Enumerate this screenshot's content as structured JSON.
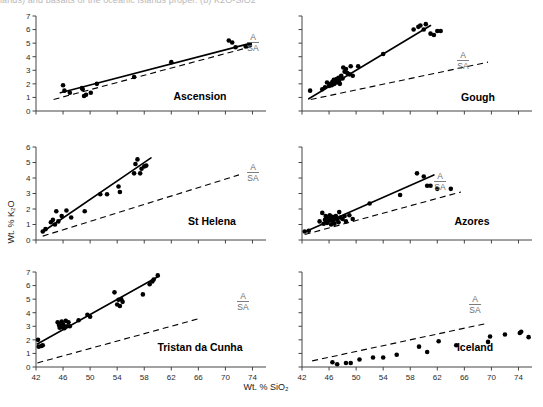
{
  "figure": {
    "top_cut_text": "lands) and basalts of the oceanic islands proper. (b)  K2O-SiO2",
    "x_axis_label": "Wt. % SiO₂",
    "y_axis_label": "Wt. % K₂O",
    "divider_label_top": "A",
    "divider_label_bottom": "SA",
    "colors": {
      "point": "#000000",
      "fit_line": "#000000",
      "divider_line": "#000000",
      "axis": "#444444",
      "label": "#6e6e6e"
    }
  },
  "chart_data": [
    {
      "type": "scatter",
      "title": "Ascension",
      "xlabel": "Wt. % SiO2",
      "ylabel": "Wt. % K2O",
      "xlim": [
        42,
        76
      ],
      "ylim": [
        0,
        7
      ],
      "xticks": [
        42,
        46,
        50,
        54,
        58,
        62,
        66,
        70,
        74
      ],
      "yticks": [
        0,
        1,
        2,
        3,
        4,
        5,
        6,
        7
      ],
      "xtick_labels_shown": false,
      "ytick_labels_shown": true,
      "grid": false,
      "annotations": [
        "A",
        "SA"
      ],
      "series": [
        {
          "name": "Ascension samples",
          "x": [
            46.0,
            46.2,
            47.0,
            48.8,
            48.9,
            49.1,
            49.4,
            50.1,
            51.0,
            56.5,
            62.0,
            70.5,
            71.0,
            71.5,
            73.0,
            73.6
          ],
          "y": [
            1.9,
            1.5,
            1.35,
            1.7,
            1.6,
            1.1,
            1.2,
            1.35,
            2.0,
            2.5,
            3.6,
            5.2,
            5.05,
            4.7,
            4.75,
            4.9
          ]
        }
      ],
      "fit_line": {
        "x": [
          45.6,
          73.8
        ],
        "y": [
          1.35,
          5.0
        ]
      },
      "divider_line": {
        "x": [
          44.6,
          73.9
        ],
        "y": [
          0.85,
          4.75
        ]
      }
    },
    {
      "type": "scatter",
      "title": "Gough",
      "xlabel": "Wt. % SiO2",
      "ylabel": "Wt. % K2O",
      "xlim": [
        42,
        76
      ],
      "ylim": [
        0,
        7
      ],
      "xticks": [
        42,
        46,
        50,
        54,
        58,
        62,
        66,
        70,
        74
      ],
      "yticks": [
        0,
        1,
        2,
        3,
        4,
        5,
        6,
        7
      ],
      "xtick_labels_shown": false,
      "ytick_labels_shown": false,
      "grid": false,
      "annotations": [
        "A",
        "SA"
      ],
      "series": [
        {
          "name": "Gough samples",
          "x": [
            43.2,
            45.0,
            45.4,
            45.7,
            46.0,
            46.2,
            46.4,
            46.5,
            46.7,
            46.8,
            47.0,
            47.1,
            47.3,
            47.4,
            47.5,
            47.6,
            47.8,
            48.0,
            48.1,
            48.3,
            48.5,
            48.7,
            49.0,
            49.2,
            49.5,
            50.3,
            54.0,
            58.5,
            59.2,
            59.5,
            60.0,
            60.3,
            61.0,
            61.5,
            62.0,
            62.5
          ],
          "y": [
            1.5,
            1.6,
            1.75,
            2.1,
            1.85,
            2.0,
            1.9,
            2.15,
            2.3,
            2.0,
            2.2,
            2.35,
            2.1,
            2.45,
            2.25,
            2.0,
            2.6,
            2.4,
            3.2,
            2.9,
            3.1,
            2.8,
            2.7,
            3.3,
            2.6,
            3.3,
            4.2,
            6.0,
            6.2,
            6.3,
            6.0,
            6.4,
            5.7,
            5.6,
            5.9,
            5.9
          ]
        }
      ],
      "fit_line": {
        "x": [
          43.0,
          61.0
        ],
        "y": [
          0.9,
          6.3
        ]
      },
      "divider_line": {
        "x": [
          43.3,
          69.5
        ],
        "y": [
          0.85,
          3.6
        ]
      }
    },
    {
      "type": "scatter",
      "title": "St Helena",
      "xlabel": "Wt. % SiO2",
      "ylabel": "Wt. % K2O",
      "xlim": [
        42,
        76
      ],
      "ylim": [
        0,
        6
      ],
      "xticks": [
        42,
        46,
        50,
        54,
        58,
        62,
        66,
        70,
        74
      ],
      "yticks": [
        0,
        1,
        2,
        3,
        4,
        5,
        6
      ],
      "xtick_labels_shown": false,
      "ytick_labels_shown": true,
      "grid": false,
      "annotations": [
        "A",
        "SA"
      ],
      "series": [
        {
          "name": "St Helena samples",
          "x": [
            43.0,
            43.4,
            44.2,
            44.5,
            44.8,
            45.0,
            45.3,
            45.8,
            46.5,
            47.2,
            49.2,
            51.5,
            52.5,
            54.2,
            54.4,
            56.5,
            56.7,
            57.0,
            57.4,
            57.6,
            58.0,
            58.3
          ],
          "y": [
            0.55,
            0.7,
            1.15,
            1.3,
            1.0,
            1.85,
            1.2,
            1.55,
            1.9,
            1.45,
            1.85,
            2.95,
            2.95,
            3.45,
            3.1,
            4.3,
            4.9,
            5.2,
            4.3,
            4.6,
            4.75,
            4.8
          ]
        }
      ],
      "fit_line": {
        "x": [
          42.9,
          59.0
        ],
        "y": [
          0.5,
          5.3
        ]
      },
      "divider_line": {
        "x": [
          43.0,
          72.0
        ],
        "y": [
          0.25,
          4.2
        ]
      }
    },
    {
      "type": "scatter",
      "title": "Azores",
      "xlabel": "Wt. % SiO2",
      "ylabel": "Wt. % K2O",
      "xlim": [
        42,
        76
      ],
      "ylim": [
        0,
        6
      ],
      "xticks": [
        42,
        46,
        50,
        54,
        58,
        62,
        66,
        70,
        74
      ],
      "yticks": [
        0,
        1,
        2,
        3,
        4,
        5,
        6
      ],
      "xtick_labels_shown": false,
      "ytick_labels_shown": false,
      "grid": false,
      "annotations": [
        "A",
        "SA"
      ],
      "series": [
        {
          "name": "Azores samples",
          "x": [
            42.4,
            43.0,
            44.6,
            45.0,
            45.2,
            45.4,
            45.5,
            45.7,
            45.8,
            46.0,
            46.1,
            46.2,
            46.3,
            46.5,
            46.6,
            46.7,
            46.8,
            47.0,
            47.2,
            47.4,
            47.5,
            47.7,
            48.0,
            48.3,
            48.5,
            49.0,
            49.5,
            52.0,
            56.5,
            59.0,
            60.0,
            60.5,
            61.0,
            62.0,
            64.0
          ],
          "y": [
            0.55,
            0.6,
            1.2,
            1.75,
            1.05,
            1.3,
            1.55,
            1.1,
            1.45,
            1.25,
            1.6,
            1.35,
            1.0,
            1.5,
            1.2,
            1.4,
            1.05,
            1.55,
            1.3,
            1.15,
            1.8,
            1.45,
            1.35,
            1.55,
            1.2,
            1.6,
            1.35,
            2.35,
            2.9,
            4.3,
            4.1,
            3.5,
            3.5,
            3.3,
            3.3
          ]
        }
      ],
      "fit_line": {
        "x": [
          42.3,
          61.5
        ],
        "y": [
          0.5,
          4.2
        ]
      },
      "divider_line": {
        "x": [
          42.4,
          65.5
        ],
        "y": [
          0.35,
          3.1
        ]
      }
    },
    {
      "type": "scatter",
      "title": "Tristan da Cunha",
      "xlabel": "Wt. % SiO2",
      "ylabel": "Wt. % K2O",
      "xlim": [
        42,
        76
      ],
      "ylim": [
        0,
        7
      ],
      "xticks": [
        42,
        46,
        50,
        54,
        58,
        62,
        66,
        70,
        74
      ],
      "yticks": [
        0,
        1,
        2,
        3,
        4,
        5,
        6,
        7
      ],
      "xtick_labels_shown": true,
      "ytick_labels_shown": true,
      "grid": false,
      "annotations": [
        "A",
        "SA"
      ],
      "series": [
        {
          "name": "Tristan da Cunha samples",
          "x": [
            42.3,
            42.4,
            42.8,
            43.0,
            45.2,
            45.4,
            45.5,
            45.6,
            45.7,
            45.8,
            45.9,
            46.0,
            46.1,
            46.2,
            46.4,
            46.6,
            46.8,
            47.0,
            48.3,
            49.6,
            50.0,
            53.6,
            54.0,
            54.2,
            54.4,
            54.6,
            54.8,
            57.8,
            58.8,
            59.2,
            59.4,
            60.0
          ],
          "y": [
            2.0,
            1.5,
            1.55,
            1.6,
            3.3,
            3.1,
            2.9,
            3.2,
            3.05,
            3.35,
            2.95,
            3.15,
            3.0,
            2.85,
            3.4,
            3.0,
            3.3,
            3.0,
            3.45,
            3.85,
            3.7,
            5.5,
            4.6,
            4.95,
            4.5,
            5.0,
            4.8,
            5.35,
            6.1,
            6.3,
            6.45,
            6.75
          ]
        }
      ],
      "fit_line": {
        "x": [
          42.2,
          60.2
        ],
        "y": [
          1.7,
          6.7
        ]
      },
      "divider_line": {
        "x": [
          42.2,
          66.0
        ],
        "y": [
          0.3,
          3.55
        ]
      }
    },
    {
      "type": "scatter",
      "title": "Iceland",
      "xlabel": "Wt. % SiO2",
      "ylabel": "Wt. % K2O",
      "xlim": [
        42,
        76
      ],
      "ylim": [
        0,
        7
      ],
      "xticks": [
        42,
        46,
        50,
        54,
        58,
        62,
        66,
        70,
        74
      ],
      "yticks": [
        0,
        1,
        2,
        3,
        4,
        5,
        6,
        7
      ],
      "xtick_labels_shown": true,
      "ytick_labels_shown": false,
      "grid": false,
      "annotations": [
        "A",
        "SA"
      ],
      "series": [
        {
          "name": "Iceland samples",
          "x": [
            46.5,
            47.2,
            48.5,
            49.2,
            50.5,
            52.5,
            54.0,
            56.0,
            59.3,
            60.5,
            62.2,
            64.8,
            69.5,
            69.8,
            72.0,
            74.2,
            74.4,
            75.5
          ],
          "y": [
            0.35,
            0.2,
            0.3,
            0.3,
            0.55,
            0.7,
            0.7,
            0.9,
            1.5,
            1.1,
            1.9,
            1.6,
            1.85,
            2.25,
            2.4,
            2.5,
            2.6,
            2.2
          ]
        }
      ],
      "fit_line": null,
      "divider_line": {
        "x": [
          43.5,
          69.2
        ],
        "y": [
          0.45,
          3.2
        ]
      }
    }
  ]
}
